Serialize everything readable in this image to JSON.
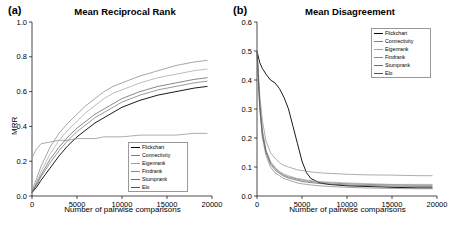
{
  "panels": {
    "a": {
      "tag": "(a)",
      "title": "Mean Reciprocal Rank",
      "xlabel": "Number of pairwise comparisons",
      "ylabel": "MRR"
    },
    "b": {
      "tag": "(b)",
      "title": "Mean Disagreement",
      "xlabel": "Number of pairwise comparisons",
      "ylabel": ""
    }
  },
  "legend": {
    "position": "bottom-right-panel-a / top-right-panel-b",
    "entries": [
      {
        "label": "Flickchart",
        "color": "#000000"
      },
      {
        "label": "Connectivity",
        "color": "#7f7f7f"
      },
      {
        "label": "Eigenrank",
        "color": "#a0a0a0"
      },
      {
        "label": "Findrank",
        "color": "#8a8a8a"
      },
      {
        "label": "Stumprank",
        "color": "#6e6e6e"
      },
      {
        "label": "Elo",
        "color": "#555555"
      }
    ]
  },
  "chart_data": [
    {
      "type": "line",
      "title": "Mean Reciprocal Rank",
      "tag": "(a)",
      "xlabel": "Number of pairwise comparisons",
      "ylabel": "MRR",
      "xlim": [
        0,
        20000
      ],
      "ylim": [
        0,
        1.0
      ],
      "xticks": [
        0,
        5000,
        10000,
        15000,
        20000
      ],
      "yticks": [
        0.0,
        0.2,
        0.4,
        0.6,
        0.8,
        1.0
      ],
      "ytick_labels": [
        "0.0",
        "0.2",
        "0.4",
        "0.6",
        "0.8",
        "1.0"
      ],
      "grid": false,
      "legend": "inside-bottom-right",
      "x": [
        0,
        500,
        1000,
        2000,
        3000,
        4000,
        5000,
        6000,
        7000,
        8000,
        9000,
        10000,
        12000,
        14000,
        16000,
        18000,
        19500
      ],
      "series": [
        {
          "name": "Flickchart",
          "color": "#000000",
          "values": [
            0.02,
            0.05,
            0.09,
            0.16,
            0.23,
            0.29,
            0.34,
            0.38,
            0.42,
            0.45,
            0.48,
            0.51,
            0.55,
            0.58,
            0.6,
            0.62,
            0.63
          ]
        },
        {
          "name": "Connectivity",
          "color": "#7f7f7f",
          "values": [
            0.03,
            0.1,
            0.17,
            0.28,
            0.36,
            0.42,
            0.47,
            0.52,
            0.56,
            0.6,
            0.63,
            0.65,
            0.69,
            0.72,
            0.75,
            0.77,
            0.78
          ]
        },
        {
          "name": "Eigenrank",
          "color": "#a0a0a0",
          "values": [
            0.02,
            0.08,
            0.14,
            0.24,
            0.32,
            0.38,
            0.43,
            0.48,
            0.52,
            0.56,
            0.59,
            0.61,
            0.65,
            0.68,
            0.7,
            0.72,
            0.73
          ]
        },
        {
          "name": "Findrank",
          "color": "#8a8a8a",
          "values": [
            0.22,
            0.27,
            0.3,
            0.31,
            0.32,
            0.32,
            0.33,
            0.33,
            0.33,
            0.34,
            0.34,
            0.34,
            0.35,
            0.35,
            0.35,
            0.36,
            0.36
          ]
        },
        {
          "name": "Stumprank",
          "color": "#6e6e6e",
          "values": [
            0.02,
            0.06,
            0.11,
            0.19,
            0.26,
            0.32,
            0.37,
            0.41,
            0.45,
            0.48,
            0.51,
            0.54,
            0.58,
            0.61,
            0.63,
            0.65,
            0.66
          ]
        },
        {
          "name": "Elo",
          "color": "#555555",
          "values": [
            0.02,
            0.07,
            0.12,
            0.21,
            0.28,
            0.34,
            0.39,
            0.43,
            0.47,
            0.5,
            0.53,
            0.56,
            0.6,
            0.63,
            0.65,
            0.67,
            0.68
          ]
        }
      ]
    },
    {
      "type": "line",
      "title": "Mean Disagreement",
      "tag": "(b)",
      "xlabel": "Number of pairwise comparisons",
      "ylabel": "",
      "xlim": [
        0,
        20000
      ],
      "ylim": [
        0,
        0.6
      ],
      "xticks": [
        0,
        5000,
        10000,
        15000,
        20000
      ],
      "yticks": [
        0.0,
        0.1,
        0.2,
        0.3,
        0.4,
        0.5,
        0.6
      ],
      "ytick_labels": [
        "0.0",
        "0.1",
        "0.2",
        "0.3",
        "0.4",
        "0.5",
        "0.6"
      ],
      "grid": false,
      "legend": "inside-top-right",
      "x": [
        0,
        300,
        600,
        1000,
        1500,
        2000,
        2500,
        3000,
        3500,
        4000,
        4500,
        5000,
        5500,
        6000,
        7000,
        8000,
        10000,
        12000,
        15000,
        18000,
        19500
      ],
      "series": [
        {
          "name": "Flickchart",
          "color": "#000000",
          "values": [
            0.5,
            0.46,
            0.44,
            0.42,
            0.4,
            0.39,
            0.37,
            0.34,
            0.3,
            0.24,
            0.18,
            0.12,
            0.08,
            0.06,
            0.045,
            0.04,
            0.035,
            0.033,
            0.03,
            0.028,
            0.028
          ]
        },
        {
          "name": "Connectivity",
          "color": "#7f7f7f",
          "values": [
            0.5,
            0.3,
            0.2,
            0.14,
            0.1,
            0.08,
            0.07,
            0.06,
            0.055,
            0.05,
            0.045,
            0.042,
            0.04,
            0.038,
            0.035,
            0.033,
            0.03,
            0.028,
            0.026,
            0.025,
            0.025
          ]
        },
        {
          "name": "Eigenrank",
          "color": "#a0a0a0",
          "values": [
            0.5,
            0.33,
            0.23,
            0.16,
            0.12,
            0.1,
            0.085,
            0.075,
            0.07,
            0.065,
            0.06,
            0.058,
            0.055,
            0.053,
            0.05,
            0.048,
            0.045,
            0.043,
            0.04,
            0.04,
            0.04
          ]
        },
        {
          "name": "Findrank",
          "color": "#8a8a8a",
          "values": [
            0.5,
            0.35,
            0.26,
            0.19,
            0.15,
            0.13,
            0.115,
            0.105,
            0.1,
            0.095,
            0.09,
            0.088,
            0.085,
            0.083,
            0.08,
            0.078,
            0.075,
            0.073,
            0.072,
            0.07,
            0.07
          ]
        },
        {
          "name": "Stumprank",
          "color": "#6e6e6e",
          "values": [
            0.5,
            0.32,
            0.22,
            0.155,
            0.115,
            0.095,
            0.082,
            0.072,
            0.066,
            0.062,
            0.058,
            0.055,
            0.052,
            0.05,
            0.047,
            0.045,
            0.042,
            0.04,
            0.038,
            0.037,
            0.037
          ]
        },
        {
          "name": "Elo",
          "color": "#555555",
          "values": [
            0.5,
            0.31,
            0.21,
            0.15,
            0.11,
            0.09,
            0.078,
            0.068,
            0.062,
            0.058,
            0.054,
            0.05,
            0.048,
            0.046,
            0.043,
            0.041,
            0.038,
            0.036,
            0.034,
            0.033,
            0.033
          ]
        }
      ]
    }
  ]
}
